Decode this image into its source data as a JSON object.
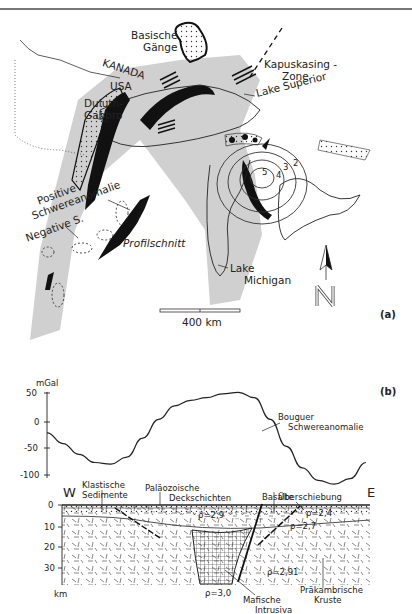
{
  "panel_a": {
    "tag": "(a)",
    "labels": {
      "basische_gaenge": [
        "Basische",
        "Gänge"
      ],
      "kanada": "KANADA",
      "usa": "USA",
      "duluth_gabbro": [
        "Duluth-",
        "Gabbro"
      ],
      "kapuskasing": [
        "Kapuskasing -",
        "Zone"
      ],
      "lake_superior": "Lake Superior",
      "positive_schwere": [
        "Positive",
        "Schwereanomalie"
      ],
      "negative_s": "Negative S.",
      "profilschnitt": "Profilschnitt",
      "lake_michigan": [
        "Lake",
        "Michigan"
      ],
      "contours": [
        "2",
        "3",
        "4",
        "5"
      ]
    },
    "scale_bar": "400 km",
    "north": "N"
  },
  "panel_b": {
    "tag": "(b)",
    "y_unit": "mGal",
    "depth_unit": "km",
    "west": "W",
    "east": "E",
    "curve_label": [
      "Bouguer",
      "Schwereanomalie"
    ],
    "layer_labels": {
      "klastische": [
        "Klastische",
        "Sedimente"
      ],
      "palaeozoische": [
        "Paläozoische",
        "Deckschichten"
      ],
      "basalte": "Basalte",
      "ueberschiebung": "Überschiebung",
      "matische": [
        "Mafische",
        "Intrusiva"
      ],
      "praekambrische": [
        "Präkambrische",
        "Kruste"
      ]
    },
    "densities": [
      "ρ=2,9",
      "ρ=2,4",
      "ρ=2,7",
      "ρ=2,91",
      "ρ=3,0"
    ]
  },
  "chart_data": {
    "type": "line",
    "xlabel": "Profile W → E",
    "ylabel": "mGal",
    "yticks": [
      50,
      0,
      -50,
      -100
    ],
    "ylim": [
      -120,
      60
    ],
    "x": [
      0,
      5,
      10,
      15,
      20,
      25,
      30,
      35,
      40,
      45,
      50,
      55,
      60,
      65,
      70,
      75,
      80,
      85,
      90,
      95,
      100
    ],
    "series": [
      {
        "name": "Bouguer Schwereanomalie",
        "values": [
          -20,
          -40,
          -60,
          -75,
          -78,
          -65,
          -30,
          5,
          30,
          40,
          45,
          52,
          55,
          45,
          5,
          -45,
          -85,
          -108,
          -115,
          -105,
          -75
        ]
      }
    ],
    "depth_axis": {
      "label": "km",
      "ticks": [
        0,
        10,
        20,
        30
      ]
    },
    "grid": false
  }
}
